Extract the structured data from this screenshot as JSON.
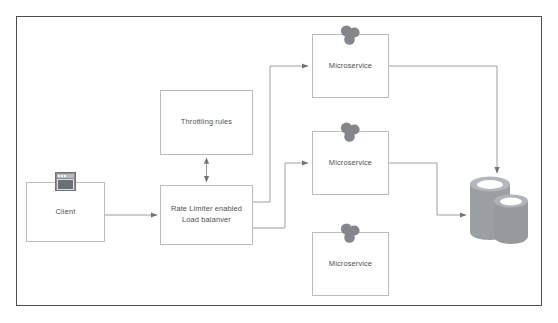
{
  "diagram": {
    "frame": {
      "border_color": "#4d4d4d"
    },
    "palette": {
      "node_border": "#b9bdc2",
      "node_fill": "#ffffff",
      "text": "#4a4f55",
      "connector": "#9a9ea3",
      "icon_gray": "#8b8f94",
      "db_gray": "#9b9fa3",
      "db_gray_dark": "#8a8e92",
      "db_gray_light": "#c9cccf"
    },
    "nodes": [
      {
        "id": "client",
        "label": "Client",
        "icon": "window-icon",
        "x": 26,
        "y": 182,
        "w": 79,
        "h": 60
      },
      {
        "id": "throttling-rules",
        "label": "Throttling rules",
        "icon": "none",
        "x": 160,
        "y": 90,
        "w": 93,
        "h": 65
      },
      {
        "id": "load-balancer",
        "label": "Rate Limiter enabled\nLoad balanver",
        "icon": "none",
        "x": 160,
        "y": 185,
        "w": 93,
        "h": 60
      },
      {
        "id": "microservice-1",
        "label": "Microservice",
        "icon": "cluster-icon",
        "x": 312,
        "y": 34,
        "w": 77,
        "h": 64
      },
      {
        "id": "microservice-2",
        "label": "Microservice",
        "icon": "cluster-icon",
        "x": 312,
        "y": 131,
        "w": 77,
        "h": 64
      },
      {
        "id": "microservice-3",
        "label": "Microservice",
        "icon": "cluster-icon",
        "x": 312,
        "y": 232,
        "w": 77,
        "h": 64
      },
      {
        "id": "database",
        "label": "",
        "icon": "database-icon",
        "x": 470,
        "y": 177,
        "w": 58,
        "h": 68
      }
    ],
    "connectors": [
      {
        "id": "client-to-load-balancer",
        "from": "client",
        "to": "load-balancer",
        "arrow": "single"
      },
      {
        "id": "throttling-rules-to-load-balancer",
        "from": "throttling-rules",
        "to": "load-balancer",
        "arrow": "double"
      },
      {
        "id": "load-balancer-to-microservice-1",
        "from": "load-balancer",
        "to": "microservice-1",
        "arrow": "single"
      },
      {
        "id": "load-balancer-to-microservice-2",
        "from": "load-balancer",
        "to": "microservice-2",
        "arrow": "single"
      },
      {
        "id": "microservice-1-to-database",
        "from": "microservice-1",
        "to": "database",
        "arrow": "single"
      },
      {
        "id": "microservice-2-to-database",
        "from": "microservice-2",
        "to": "database",
        "arrow": "single"
      }
    ]
  }
}
